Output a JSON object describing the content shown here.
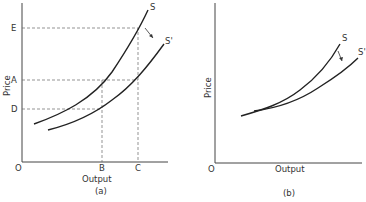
{
  "panel_a": {
    "caption": "(a)",
    "x_label": "Output",
    "y_label": "Price",
    "origin_label": "O",
    "y_ticks": [
      {
        "label": "E",
        "y": 28
      },
      {
        "label": "A",
        "y": 80
      },
      {
        "label": "D",
        "y": 109
      }
    ],
    "x_ticks": [
      {
        "label": "B",
        "x": 102
      },
      {
        "label": "C",
        "x": 138
      }
    ],
    "curves": [
      {
        "label": "S"
      },
      {
        "label": "S'"
      }
    ]
  },
  "panel_b": {
    "caption": "(b)",
    "x_label": "Output",
    "y_label": "Price",
    "origin_label": "O",
    "curves": [
      {
        "label": "S"
      },
      {
        "label": "S'"
      }
    ]
  },
  "colors": {
    "ink": "#222222",
    "dashed": "#666666",
    "background": "#ffffff"
  }
}
